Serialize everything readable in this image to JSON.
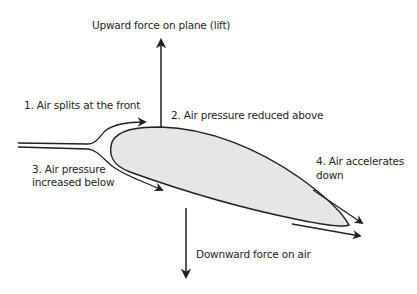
{
  "diagram": {
    "type": "airfoil-lift",
    "colors": {
      "stroke": "#231f20",
      "airfoil_fill": "#e6e6e6",
      "background": "#ffffff"
    },
    "labels": {
      "lift": "Upward force on plane (lift)",
      "step1": "1. Air splits at the front",
      "step2": "2. Air pressure reduced above",
      "step3_line1": "3. Air pressure",
      "step3_line2": "increased below",
      "step4_line1": "4. Air accelerates",
      "step4_line2": "down",
      "downward": "Downward force on air"
    },
    "elements": [
      "airfoil",
      "lift-arrow",
      "downward-force-arrow",
      "upper-flow-arrow",
      "lower-flow-arrow",
      "trailing-upper-arrow",
      "trailing-lower-arrow",
      "incoming-flow-lines"
    ]
  }
}
